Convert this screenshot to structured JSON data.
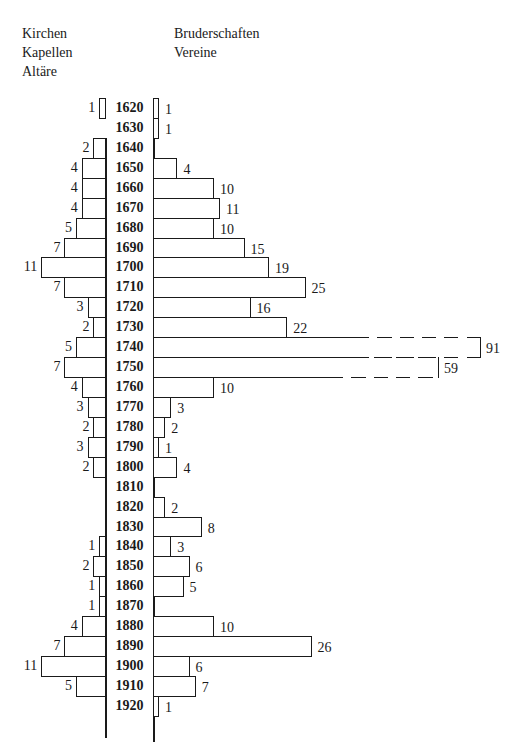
{
  "legend": {
    "left": [
      "Kirchen",
      "Kapellen",
      "Altäre"
    ],
    "right": [
      "Bruderschaften",
      "Vereine"
    ]
  },
  "chart_data": {
    "type": "bar",
    "orientation": "horizontal-butterfly",
    "title": "",
    "categories": [
      "1620",
      "1630",
      "1640",
      "1650",
      "1660",
      "1670",
      "1680",
      "1690",
      "1700",
      "1710",
      "1720",
      "1730",
      "1740",
      "1750",
      "1760",
      "1770",
      "1780",
      "1790",
      "1800",
      "1810",
      "1820",
      "1830",
      "1840",
      "1850",
      "1860",
      "1870",
      "1880",
      "1890",
      "1900",
      "1910",
      "1920"
    ],
    "series": [
      {
        "name": "Kirchen, Kapellen, Altäre",
        "side": "left",
        "values": [
          1,
          0,
          2,
          4,
          4,
          4,
          5,
          7,
          11,
          7,
          3,
          2,
          5,
          7,
          4,
          3,
          2,
          3,
          2,
          0,
          0,
          0,
          1,
          2,
          1,
          1,
          4,
          7,
          11,
          5,
          0
        ]
      },
      {
        "name": "Bruderschaften, Vereine",
        "side": "right",
        "values": [
          1,
          1,
          0,
          4,
          10,
          11,
          10,
          15,
          19,
          25,
          16,
          22,
          91,
          59,
          10,
          3,
          2,
          1,
          4,
          0,
          2,
          8,
          3,
          6,
          5,
          0,
          10,
          26,
          6,
          7,
          1
        ],
        "broken_bars": [
          "1740",
          "1750"
        ]
      }
    ],
    "xlabel": "",
    "ylabel": "",
    "grid": false,
    "legend_position": "top"
  },
  "layout": {
    "left_axis_x": 105,
    "right_axis_x": 153,
    "first_row_y": 98,
    "row_height": 19.93,
    "left_px_per_unit": 5.8,
    "right_px_per_unit": 6.1,
    "broken_bar_px": {
      "1740": 327,
      "1750": 285
    }
  }
}
